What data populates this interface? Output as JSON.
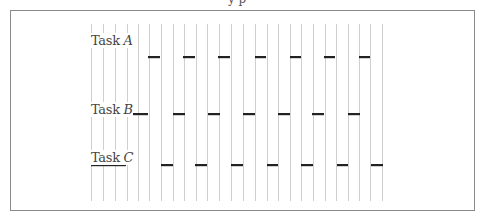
{
  "diagram": {
    "type": "timeline",
    "top_text_cutoff": "y p",
    "grid_line_x": [
      91,
      103,
      115,
      127,
      138,
      149,
      161,
      173,
      184,
      196,
      207,
      219,
      231,
      243,
      255,
      267,
      278,
      290,
      301,
      313,
      325,
      336,
      348,
      359,
      370,
      382
    ],
    "grid_y_range": [
      24,
      201
    ],
    "colors": {
      "grid": "#cfcfcf",
      "bar": "#222222",
      "frame": "#8a8a8a",
      "text": "#444444"
    },
    "tasks": [
      {
        "name": "Task",
        "letter": "A",
        "label_x": 91,
        "label_y": 33,
        "bar_y": 57,
        "bars": [
          [
            148,
            160
          ],
          [
            183,
            195
          ],
          [
            218,
            230
          ],
          [
            255,
            266
          ],
          [
            290,
            301
          ],
          [
            324,
            335
          ],
          [
            359,
            370
          ]
        ]
      },
      {
        "name": "Task",
        "letter": "B",
        "label_x": 91,
        "label_y": 102,
        "bar_y": 114,
        "bars": [
          [
            126,
            148
          ],
          [
            173,
            185
          ],
          [
            208,
            220
          ],
          [
            243,
            255
          ],
          [
            278,
            290
          ],
          [
            312,
            324
          ],
          [
            348,
            360
          ]
        ]
      },
      {
        "name": "Task",
        "letter": "C",
        "label_x": 91,
        "label_y": 150,
        "bar_y": 165,
        "bars": [
          [
            91,
            126
          ],
          [
            161,
            173
          ],
          [
            195,
            207
          ],
          [
            231,
            243
          ],
          [
            267,
            278
          ],
          [
            301,
            313
          ],
          [
            337,
            348
          ],
          [
            371,
            383
          ]
        ]
      }
    ]
  }
}
